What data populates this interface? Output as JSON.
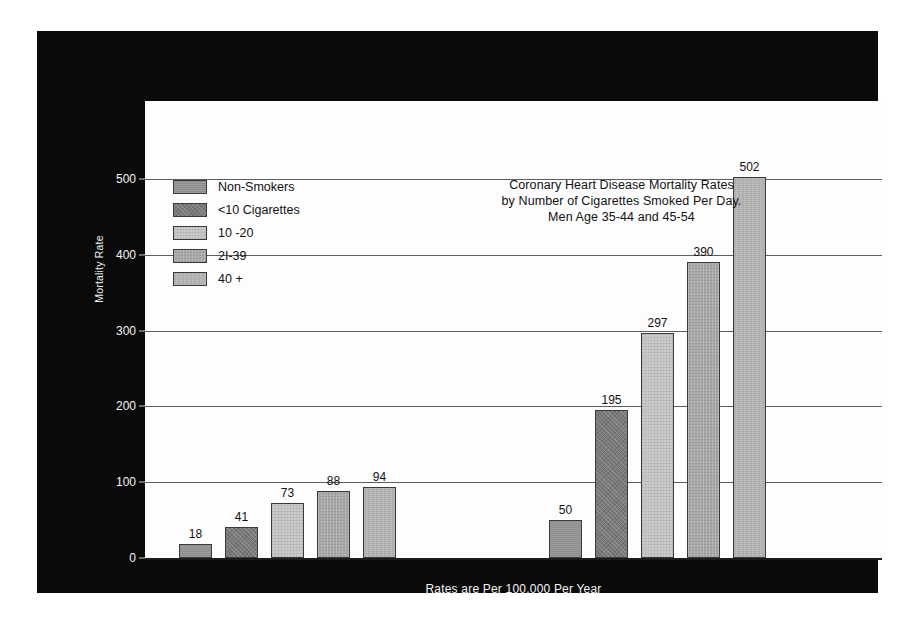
{
  "chart_data": {
    "type": "bar",
    "title_lines": [
      "Coronary Heart Disease Mortality Rates",
      "by Number of Cigarettes Smoked Per Day.",
      "Men Age 35-44 and 45-54"
    ],
    "xlabel": "Rates are Per 100,000 Per Year",
    "ylabel": "Mortality Rate",
    "ylim": [
      0,
      500
    ],
    "yticks": [
      0,
      100,
      200,
      300,
      400,
      500
    ],
    "ytick_labels": [
      "0",
      "100",
      "200",
      "300",
      "400",
      "500"
    ],
    "grid": true,
    "legend_position": "upper-left-inside",
    "categories": [
      "Men Age 35-44",
      "Men Age 45-54"
    ],
    "series": [
      {
        "name": "Non-Smokers",
        "values": [
          18,
          50
        ]
      },
      {
        "name": "<10 Cigarettes",
        "values": [
          41,
          195
        ]
      },
      {
        "name": "10 -20",
        "values": [
          73,
          297
        ]
      },
      {
        "name": "2I-39",
        "values": [
          88,
          390
        ]
      },
      {
        "name": "40 +",
        "values": [
          94,
          502
        ]
      }
    ],
    "bars": [
      {
        "group": 0,
        "series": 0,
        "label": "Non-Smokers",
        "value": 18,
        "value_label": "18",
        "fill": "s1"
      },
      {
        "group": 0,
        "series": 1,
        "label": "<10 Cigarettes",
        "value": 41,
        "value_label": "41",
        "fill": "s2"
      },
      {
        "group": 0,
        "series": 2,
        "label": "10 -20",
        "value": 73,
        "value_label": "73",
        "fill": "s3"
      },
      {
        "group": 0,
        "series": 3,
        "label": "2I-39",
        "value": 88,
        "value_label": "88",
        "fill": "s4"
      },
      {
        "group": 0,
        "series": 4,
        "label": "40 +",
        "value": 94,
        "value_label": "94",
        "fill": "s5"
      },
      {
        "group": 1,
        "series": 0,
        "label": "Non-Smokers",
        "value": 50,
        "value_label": "50",
        "fill": "s1"
      },
      {
        "group": 1,
        "series": 1,
        "label": "<10 Cigarettes",
        "value": 195,
        "value_label": "195",
        "fill": "s2"
      },
      {
        "group": 1,
        "series": 2,
        "label": "10 -20",
        "value": 297,
        "value_label": "297",
        "fill": "s3"
      },
      {
        "group": 1,
        "series": 3,
        "label": "2I-39",
        "value": 390,
        "value_label": "390",
        "fill": "s4"
      },
      {
        "group": 1,
        "series": 4,
        "label": "40 +",
        "value": 502,
        "value_label": "502",
        "fill": "s5"
      }
    ],
    "colors": {
      "s1": "#8e8e8e",
      "s2": "#797979",
      "s3": "#cacaca",
      "s4": "#a7a7a7",
      "s5": "#b2b2b2",
      "panel_background": "#0a0a0a",
      "plot_background": "#fdfdfd",
      "gridline": "#5e5e5e",
      "text_on_dark": "#f4f4f4",
      "text_on_light": "#111111"
    }
  },
  "legend": {
    "items": [
      {
        "label": "Non-Smokers",
        "fill": "s1"
      },
      {
        "label": "<10 Cigarettes",
        "fill": "s2"
      },
      {
        "label": "10 -20",
        "fill": "s3"
      },
      {
        "label": "2I-39",
        "fill": "s4"
      },
      {
        "label": "40 +",
        "fill": "s5"
      }
    ]
  }
}
